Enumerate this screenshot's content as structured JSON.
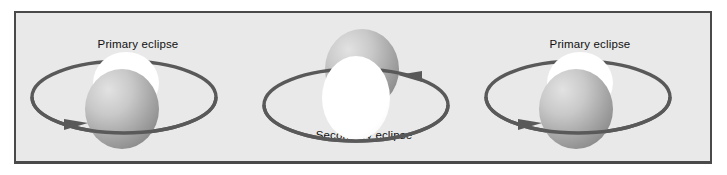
{
  "figure": {
    "background_color": "#e9e9e9",
    "border_color": "#4a4a4a",
    "page_color": "#ffffff"
  },
  "colors": {
    "orbit_stroke": "#595959",
    "bright_star": "#ffffff",
    "dark_star_light": "#d8d8d8",
    "dark_star_dark": "#8a8a8a",
    "label_text": "#101010"
  },
  "panels": [
    {
      "id": "left",
      "label": "Primary eclipse",
      "label_position": "top",
      "front_star": "dark-star",
      "back_star": "bright-star",
      "orbit_direction": "clockwise",
      "arrow_position": "bottom-left",
      "arrow_points": "right"
    },
    {
      "id": "middle",
      "label": "Secondary eclipse",
      "label_position": "bottom",
      "front_star": "bright-star",
      "back_star": "dark-star",
      "orbit_direction": "counterclockwise",
      "arrow_position": "top-right",
      "arrow_points": "left"
    },
    {
      "id": "right",
      "label": "Primary eclipse",
      "label_position": "top",
      "front_star": "dark-star",
      "back_star": "bright-star",
      "orbit_direction": "clockwise",
      "arrow_position": "bottom-left",
      "arrow_points": "right"
    }
  ]
}
